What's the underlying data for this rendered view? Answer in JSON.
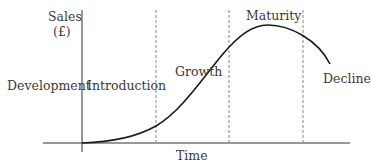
{
  "diagram": {
    "type": "product-life-cycle",
    "y_axis_label_line1": "Sales",
    "y_axis_label_line2": "(£)",
    "x_axis_label": "Time",
    "stages": [
      {
        "label": "Development"
      },
      {
        "label": "Introduction"
      },
      {
        "label": "Growth"
      },
      {
        "label": "Maturity"
      },
      {
        "label": "Decline"
      }
    ],
    "colors": {
      "line": "#1a1a1a",
      "axis": "#333333",
      "divider": "#888888",
      "text": "#3a3a3a"
    }
  }
}
